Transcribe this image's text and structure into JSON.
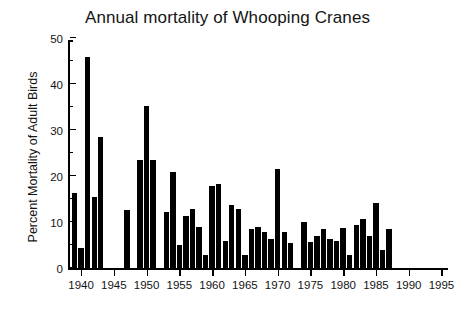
{
  "chart_data": {
    "type": "bar",
    "title": "Annual mortality of Whooping Cranes",
    "xlabel": "",
    "ylabel": "Percent Mortality of Adult Birds",
    "xlim": [
      1938,
      1996
    ],
    "ylim": [
      0,
      50
    ],
    "grid": false,
    "legend": null,
    "y_ticks_major": [
      0,
      10,
      20,
      30,
      40,
      50
    ],
    "y_ticks_minor": [
      5,
      15,
      25,
      35,
      45
    ],
    "x_ticks": [
      1940,
      1945,
      1950,
      1955,
      1960,
      1965,
      1970,
      1975,
      1980,
      1985,
      1990,
      1995
    ],
    "bar_color": "#000000",
    "categories": [
      1939,
      1940,
      1941,
      1942,
      1943,
      1947,
      1949,
      1950,
      1951,
      1953,
      1954,
      1955,
      1956,
      1957,
      1958,
      1959,
      1960,
      1961,
      1962,
      1963,
      1964,
      1965,
      1966,
      1967,
      1968,
      1969,
      1970,
      1971,
      1972,
      1974,
      1975,
      1976,
      1977,
      1978,
      1979,
      1980,
      1981,
      1982,
      1983,
      1984,
      1985,
      1986,
      1987
    ],
    "values": [
      16.5,
      4.5,
      46.0,
      15.5,
      28.5,
      12.8,
      23.5,
      35.3,
      23.5,
      12.3,
      21.0,
      5.0,
      11.5,
      13.0,
      9.0,
      3.0,
      18.0,
      18.3,
      6.0,
      13.8,
      13.0,
      3.0,
      8.5,
      9.0,
      8.0,
      6.5,
      21.7,
      8.0,
      5.5,
      10.0,
      5.8,
      7.0,
      8.5,
      6.5,
      6.0,
      8.8,
      3.0,
      9.5,
      10.8,
      7.0,
      14.3,
      4.0,
      8.5
    ],
    "missing_years": [
      1944,
      1945,
      1946,
      1948,
      1952,
      1973
    ]
  }
}
